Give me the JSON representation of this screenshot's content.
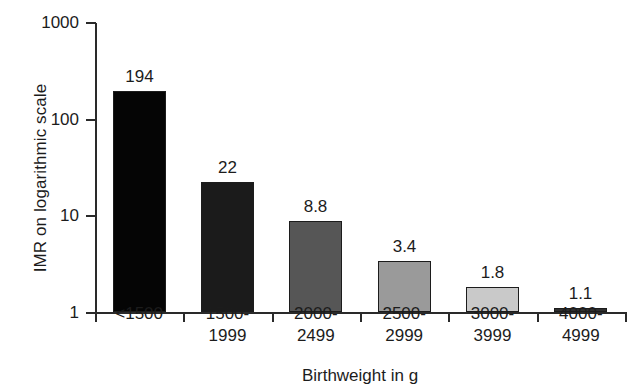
{
  "chart_data": {
    "type": "bar",
    "title": "",
    "xlabel": "Birthweight in g",
    "ylabel": "IMR on logarithmic scale",
    "yscale": "log",
    "ylim": [
      1,
      1000
    ],
    "ytick_labels": [
      "1000",
      "100",
      "10",
      "1"
    ],
    "ytick_values": [
      1000,
      100,
      10,
      1
    ],
    "grid": false,
    "legend": "none",
    "categories": [
      "<1500",
      "1500-1999",
      "2000-2499",
      "2500-2999",
      "3000-3999",
      "4000-4999"
    ],
    "category_lines": [
      [
        "<1500",
        ""
      ],
      [
        "1500-",
        "1999"
      ],
      [
        "2000-",
        "2499"
      ],
      [
        "2500-",
        "2999"
      ],
      [
        "3000-",
        "3999"
      ],
      [
        "4000-",
        "4999"
      ]
    ],
    "values": [
      194,
      22,
      8.8,
      3.4,
      1.8,
      1.1
    ],
    "value_labels": [
      "194",
      "22",
      "8.8",
      "3.4",
      "1.8",
      "1.1"
    ],
    "bar_colors": [
      "#050505",
      "#1b1b1b",
      "#565656",
      "#9a9a9a",
      "#c9c9c9",
      "#2f2f2f"
    ],
    "bar_border_color": "#1c1c1c"
  },
  "axis": {
    "line_color": "#2a2a2a"
  }
}
